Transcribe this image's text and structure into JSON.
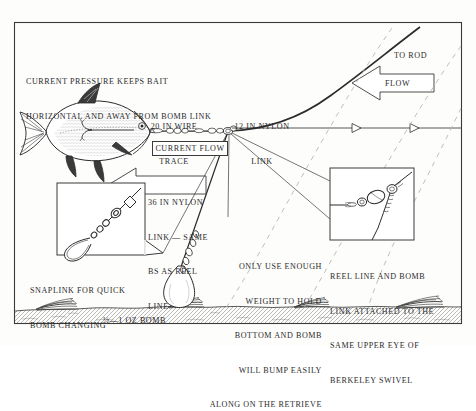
{
  "figure": {
    "border_color": "#3a3a3a",
    "ink_color": "#2b2b2b",
    "background": "#fdfdfb"
  },
  "annotations": {
    "current_pressure": {
      "line1": "CURRENT PRESSURE KEEPS BAIT",
      "line2": "HORIZONTAL AND AWAY FROM BOMB LINK"
    },
    "wire_trace": {
      "line1": "20 IN WIRE",
      "line2": "TRACE"
    },
    "nylon_link_12": {
      "line1": "12 IN NYLON",
      "line2": "LINK"
    },
    "to_rod": "TO ROD",
    "flow_box": "FLOW",
    "current_flow_box": "CURRENT FLOW",
    "nylon_link_36": {
      "line1": "36 IN NYLON",
      "line2": "LINK — SAME",
      "line3": "BS AS REEL",
      "line4": "LINE"
    },
    "weight_advice": {
      "line1": "ONLY USE ENOUGH",
      "line2": "WEIGHT TO HOLD",
      "line3": "BOTTOM AND BOMB",
      "line4": "WILL BUMP EASILY",
      "line5": "ALONG ON THE RETRIEVE"
    },
    "snaplink": {
      "line1": "SNAPLINK FOR QUICK",
      "line2": "BOMB CHANGING"
    },
    "swivel_note": {
      "line1": "REEL LINE AND BOMB",
      "line2": "LINK ATTACHED TO THE",
      "line3": "SAME UPPER EYE OF",
      "line4": "BERKELEY SWIVEL"
    },
    "bomb_weight": "½—1 OZ BOMB"
  },
  "icons": {
    "fish": "fish-bait-icon",
    "treble_hook": "treble-hook-icon",
    "bomb_weight": "bomb-weight-icon",
    "swivel": "swivel-icon",
    "snaplink": "snaplink-icon",
    "flow_arrow": "flow-arrow-icon",
    "current_arrow": "current-arrow-icon",
    "seabed": "seabed-icon",
    "weed": "weed-tuft-icon"
  }
}
